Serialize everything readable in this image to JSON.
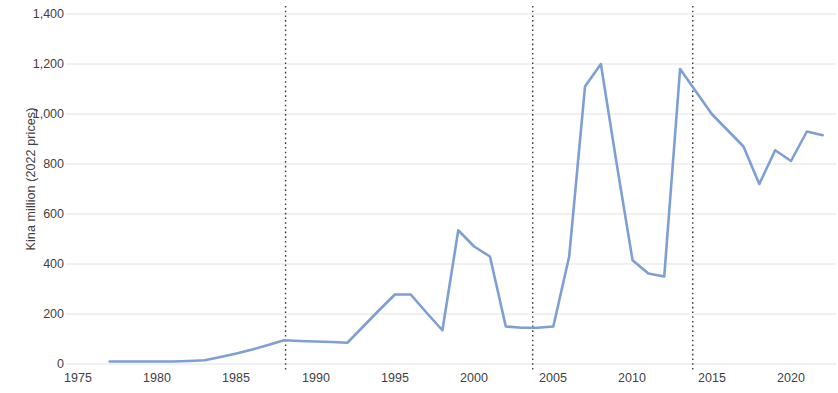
{
  "chart_data": {
    "type": "line",
    "title": "",
    "subtitle": "",
    "xlabel": "",
    "ylabel": "Kina million (2022 prices)",
    "xlim": [
      1975,
      2022.5
    ],
    "ylim": [
      0,
      1400
    ],
    "ytick_labels": [
      "0",
      "200",
      "400",
      "600",
      "800",
      "1,000",
      "1,200",
      "1,400"
    ],
    "ytick_values": [
      0,
      200,
      400,
      600,
      800,
      1000,
      1200,
      1400
    ],
    "xtick_labels": [
      "1975",
      "1980",
      "1985",
      "1990",
      "1995",
      "2000",
      "2005",
      "2010",
      "2015",
      "2020"
    ],
    "xtick_values": [
      1975,
      1980,
      1985,
      1990,
      1995,
      2000,
      2005,
      2010,
      2015,
      2020
    ],
    "grid": "horizontal",
    "legend": "none",
    "series": [
      {
        "name": "Kina million (2022 prices)",
        "color": "#7d9fd4",
        "x": [
          1977,
          1978,
          1979,
          1980,
          1981,
          1982,
          1983,
          1984,
          1985,
          1986,
          1987,
          1988,
          1989,
          1990,
          1991,
          1992,
          1993,
          1994,
          1995,
          1996,
          1997,
          1998,
          1999,
          2000,
          2001,
          2002,
          2003,
          2004,
          2005,
          2006,
          2007,
          2008,
          2009,
          2010,
          2011,
          2012,
          2013,
          2014,
          2015,
          2016,
          2017,
          2018,
          2019,
          2020,
          2021,
          2022
        ],
        "values": [
          10,
          10,
          10,
          10,
          10,
          12,
          15,
          28,
          42,
          58,
          76,
          95,
          92,
          90,
          88,
          85,
          150,
          215,
          278,
          278,
          205,
          135,
          535,
          470,
          430,
          150,
          145,
          145,
          150,
          430,
          1110,
          1200,
          800,
          415,
          362,
          350,
          1180,
          1090,
          1000,
          935,
          870,
          720,
          855,
          812,
          930,
          915
        ]
      }
    ],
    "vertical_markers": [
      {
        "name": "marker-1988",
        "x": 1988.1,
        "style": "dotted",
        "color": "#3a3a3a"
      },
      {
        "name": "marker-2003",
        "x": 2003.7,
        "style": "dotted",
        "color": "#3a3a3a"
      },
      {
        "name": "marker-2013",
        "x": 2013.8,
        "style": "dotted",
        "color": "#3a3a3a"
      }
    ]
  },
  "colors": {
    "line": "#7d9fd4",
    "gridline": "#e2e2e2",
    "marker": "#3a3a3a",
    "text": "#3f3f3f",
    "background": "#ffffff"
  }
}
